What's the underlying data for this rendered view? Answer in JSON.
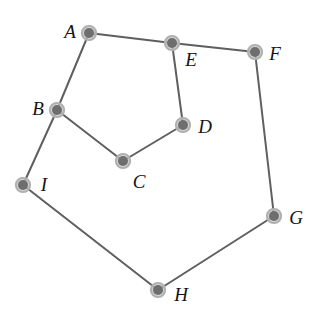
{
  "diagram": {
    "type": "node-link-graph",
    "background_color": "#ffffff",
    "width": 318,
    "height": 329,
    "style": {
      "edge_color": "#5f5f5f",
      "edge_width": 2,
      "node_core_color": "#6e6e6e",
      "node_core_radius": 5,
      "node_halo_color": "#c9c9c9",
      "node_halo_radius": 9,
      "node_ring_color": "#b0b0b0",
      "label_color": "#141414",
      "label_font_size": 19,
      "label_style": "italic-serif"
    },
    "nodes": [
      {
        "id": "A",
        "label": "A",
        "x": 89,
        "y": 33,
        "label_x": 70,
        "label_y": 31
      },
      {
        "id": "B",
        "label": "B",
        "x": 57,
        "y": 110,
        "label_x": 38,
        "label_y": 108
      },
      {
        "id": "C",
        "label": "C",
        "x": 123,
        "y": 161,
        "label_x": 139,
        "label_y": 181
      },
      {
        "id": "D",
        "label": "D",
        "x": 183,
        "y": 125,
        "label_x": 205,
        "label_y": 126
      },
      {
        "id": "E",
        "label": "E",
        "x": 172,
        "y": 43,
        "label_x": 191,
        "label_y": 59
      },
      {
        "id": "F",
        "label": "F",
        "x": 255,
        "y": 52,
        "label_x": 275,
        "label_y": 53
      },
      {
        "id": "G",
        "label": "G",
        "x": 274,
        "y": 216,
        "label_x": 296,
        "label_y": 217
      },
      {
        "id": "H",
        "label": "H",
        "x": 158,
        "y": 290,
        "label_x": 181,
        "label_y": 294
      },
      {
        "id": "I",
        "label": "I",
        "x": 23,
        "y": 185,
        "label_x": 44,
        "label_y": 184
      }
    ],
    "edges": [
      {
        "from": "A",
        "to": "E"
      },
      {
        "from": "E",
        "to": "F"
      },
      {
        "from": "A",
        "to": "B"
      },
      {
        "from": "E",
        "to": "D"
      },
      {
        "from": "D",
        "to": "C"
      },
      {
        "from": "C",
        "to": "B"
      },
      {
        "from": "B",
        "to": "I"
      },
      {
        "from": "F",
        "to": "G"
      },
      {
        "from": "I",
        "to": "H"
      },
      {
        "from": "H",
        "to": "G"
      }
    ]
  }
}
